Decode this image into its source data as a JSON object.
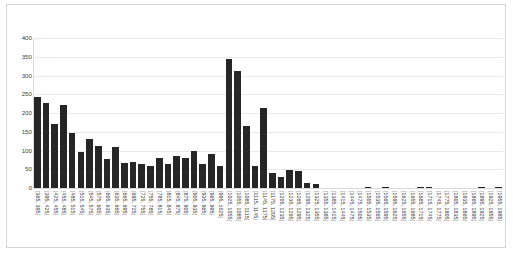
{
  "chart_data": {
    "type": "bar",
    "title": "",
    "subtitle": "",
    "xlabel": "",
    "ylabel": "",
    "ylim": [
      0,
      400
    ],
    "yticks": [
      0,
      50,
      100,
      150,
      200,
      250,
      300,
      350,
      400
    ],
    "grid": true,
    "legend": false,
    "bar_color": "#262626",
    "bin_width": 30,
    "categories": [
      "[365, 395]",
      "[395, 425]",
      "[425, 455]",
      "[455, 485]",
      "[485, 515]",
      "[515, 545]",
      "[545, 575]",
      "[575, 605]",
      "[605, 635]",
      "[635, 665]",
      "[665, 695]",
      "[695, 725]",
      "[725, 755]",
      "[755, 785]",
      "[785, 815]",
      "[815, 845]",
      "[845, 875]",
      "[875, 905]",
      "[905, 935]",
      "[935, 965]",
      "[965, 995]",
      "[995, 1025]",
      "[1025, 1055]",
      "[1055, 1085]",
      "[1085, 1115]",
      "[1115, 1145]",
      "[1145, 1175]",
      "[1175, 1205]",
      "[1205, 1235]",
      "[1235, 1265]",
      "[1265, 1295]",
      "[1295, 1325]",
      "[1325, 1355]",
      "[1355, 1385]",
      "[1385, 1415]",
      "[1415, 1445]",
      "[1445, 1475]",
      "[1475, 1505]",
      "[1505, 1535]",
      "[1535, 1565]",
      "[1565, 1595]",
      "[1595, 1625]",
      "[1625, 1655]",
      "[1655, 1685]",
      "[1685, 1715]",
      "[1715, 1745]",
      "[1745, 1775]",
      "[1775, 1805]",
      "[1805, 1835]",
      "[1835, 1865]",
      "[1865, 1895]",
      "[1895, 1925]",
      "[1925, 1955]",
      "[1955, 1985]"
    ],
    "values": [
      242,
      228,
      172,
      221,
      147,
      95,
      130,
      112,
      78,
      110,
      66,
      70,
      64,
      59,
      81,
      64,
      85,
      79,
      100,
      63,
      90,
      59,
      345,
      313,
      166,
      59,
      213,
      41,
      29,
      49,
      45,
      13,
      10,
      0,
      0,
      0,
      0,
      0,
      3,
      0,
      3,
      0,
      0,
      0,
      2,
      1,
      0,
      0,
      0,
      0,
      0,
      2,
      0,
      1
    ]
  }
}
